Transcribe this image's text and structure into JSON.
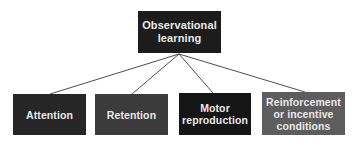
{
  "diagram": {
    "root": {
      "label_line1": "Observational",
      "label_line2": "learning",
      "color": "#1c1c1c"
    },
    "children": [
      {
        "label_line1": "Attention",
        "label_line2": "",
        "label_line3": "",
        "color": "#262626"
      },
      {
        "label_line1": "Retention",
        "label_line2": "",
        "label_line3": "",
        "color": "#3b3b3b"
      },
      {
        "label_line1": "Motor",
        "label_line2": "reproduction",
        "label_line3": "",
        "color": "#151515"
      },
      {
        "label_line1": "Reinforcement",
        "label_line2": "or incentive",
        "label_line3": "conditions",
        "color": "#5d5d5d"
      }
    ],
    "line_color": "#3a3a3a"
  }
}
